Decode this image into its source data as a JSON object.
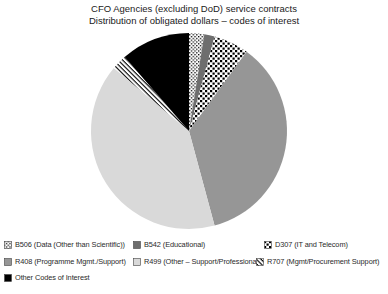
{
  "chart_data": {
    "type": "pie",
    "title": "CFO Agencies (excluding DoD) service contracts",
    "subtitle": "Distribution of obligated dollars – codes of interest",
    "direction": "clockwise",
    "start_angle_deg_from_12": 0,
    "legend_position": "bottom",
    "center": {
      "x": 189,
      "y": 131,
      "radius": 98
    },
    "slices": [
      {
        "code": "B506",
        "label": "B506 (Data (Other than Scientific))",
        "percent": 2.5,
        "fill_type": "fine-check",
        "fg": "#000000",
        "bg": "#ffffff"
      },
      {
        "code": "B542",
        "label": "B542 (Educational)",
        "percent": 1.7,
        "fill_type": "solid",
        "color": "#6e6e6e"
      },
      {
        "code": "D307",
        "label": "D307 (IT and Telecom)",
        "percent": 5.8,
        "fill_type": "checkerboard",
        "fg": "#000000",
        "bg": "#ffffff"
      },
      {
        "code": "R408",
        "label": "R408 (Programme Mgmt./Support)",
        "percent": 35.8,
        "fill_type": "solid",
        "color": "#969696"
      },
      {
        "code": "R499",
        "label": "R499 (Other – Support/Professional)",
        "percent": 40.3,
        "fill_type": "solid",
        "color": "#d9d9d9"
      },
      {
        "code": "R707",
        "label": "R707 (Mgmt/Procurement Support)",
        "percent": 2.5,
        "fill_type": "diagonal-stripes",
        "fg": "#000000",
        "bg": "#ffffff"
      },
      {
        "code": "OTHER",
        "label": "Other Codes of Interest",
        "percent": 11.4,
        "fill_type": "solid",
        "color": "#000000"
      }
    ]
  }
}
